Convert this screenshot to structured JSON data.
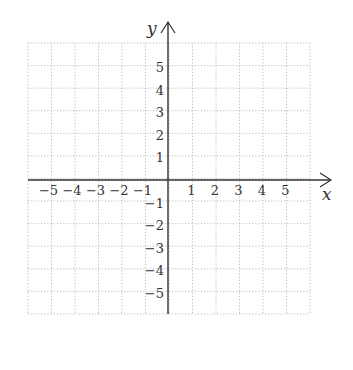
{
  "chart_data": {
    "type": "coordinate-grid",
    "title": "",
    "xlabel": "x",
    "ylabel": "y",
    "xlim": [
      -6,
      6
    ],
    "ylim": [
      -6,
      6
    ],
    "grid": true,
    "grid_style": "dotted",
    "x_ticks": [
      "-5",
      "-4",
      "-3",
      "-2",
      "-1",
      "1",
      "2",
      "3",
      "4",
      "5"
    ],
    "y_ticks": [
      "5",
      "4",
      "3",
      "2",
      "1",
      "-1",
      "-2",
      "-3",
      "-4",
      "-5"
    ],
    "series": []
  },
  "axes": {
    "x_label": "x",
    "y_label": "y"
  },
  "colors": {
    "axis": "#333333",
    "grid": "#aaaaaa",
    "text": "#333333"
  }
}
